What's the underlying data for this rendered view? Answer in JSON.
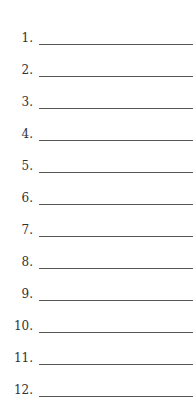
{
  "items": [
    {
      "label": "1."
    },
    {
      "label": "2."
    },
    {
      "label": "3."
    },
    {
      "label": "4."
    },
    {
      "label": "5."
    },
    {
      "label": "6."
    },
    {
      "label": "7."
    },
    {
      "label": "8."
    },
    {
      "label": "9."
    },
    {
      "label": "10."
    },
    {
      "label": "11."
    },
    {
      "label": "12."
    }
  ]
}
